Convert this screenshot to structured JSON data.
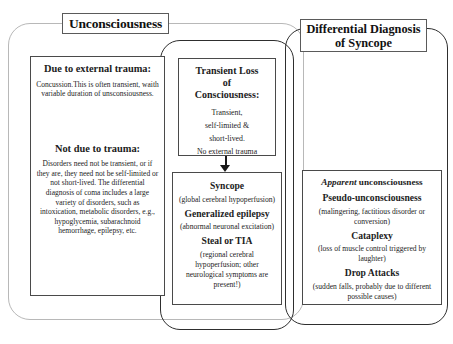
{
  "titles": {
    "unconsciousness": "Unconsciousness",
    "ddx_line1": "Differential Diagnosis",
    "ddx_line2": "of Syncope"
  },
  "left_column": {
    "trauma_heading": "Due to external trauma:",
    "trauma_body": "Concussion.This is often transient, waith variable duration of unsconsiousness.",
    "no_trauma_heading": "Not due to trauma:",
    "no_trauma_body": "Disorders need not be transient, or if they are, they need not be self-limited or not short-lived. The differential diagnosis of coma includes a large variety of disorders, such as intoxication, metabolic disorders, e.g., hypoglycemia, subarachnoid hemorrhage, epilepsy, etc."
  },
  "middle_column": {
    "tloc_heading_line1": "Transient Loss",
    "tloc_heading_line2": "of",
    "tloc_heading_line3": "Consciousness:",
    "tloc_item1": "Transient,",
    "tloc_item2": "self-limited &",
    "tloc_item3": "short-lived.",
    "tloc_item4": "No external trauma",
    "syncope_heading": "Syncope",
    "syncope_body": "(global cerebral hypoperfusion)",
    "epilepsy_heading": "Generalized epilepsy",
    "epilepsy_body": "(abnormal neuronal excitation)",
    "steal_heading": "Steal or TIA",
    "steal_body": "(regional cerebral hypoperfusion; other neurological symptoms are present!)"
  },
  "right_column": {
    "apparent_italic": "Apparent",
    "apparent_rest": " unconsciousness",
    "pseudo_heading": "Pseudo-unconsciousness",
    "pseudo_body": "(malingering, factitious disorder or conversion)",
    "cataplexy_heading": "Cataplexy",
    "cataplexy_body": "(loss of muscle control triggered by laughter)",
    "drop_heading": "Drop Attacks",
    "drop_body": "(sudden falls, probably due to different possible causes)"
  },
  "colors": {
    "outer_frame": "#b8b8b8",
    "dark_frame": "#2e2e2e",
    "box_border": "#4a4a4a",
    "text": "#1a1a1a",
    "background": "#ffffff"
  }
}
